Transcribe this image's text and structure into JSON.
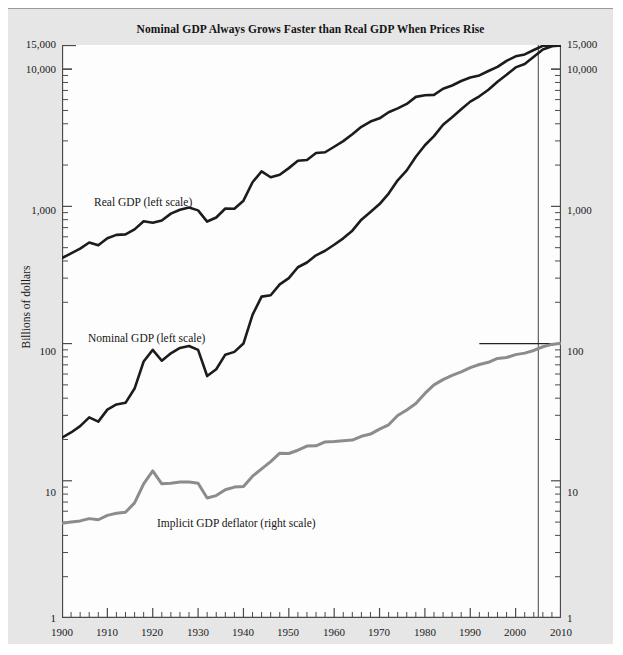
{
  "figure": {
    "title": "Nominal GDP Always Grows Faster than Real GDP When Prices Rise",
    "y_axis_left_title": "Billions of dollars",
    "y_axis_right_title": "Price index (the year 2005=100)",
    "background_color": "#e6e6e6",
    "plot_background_color": "#fdfdfd"
  },
  "series_labels": {
    "real_gdp": "Real GDP (left scale)",
    "nominal_gdp": "Nominal GDP (left scale)",
    "deflator": "Implicit GDP deflator (right scale)"
  },
  "axis_ticks": {
    "left": [
      "15,000",
      "10,000",
      "1,000",
      "100",
      "10",
      "1"
    ],
    "right": [
      "15,000",
      "10,000",
      "1,000",
      "100",
      "10",
      "1"
    ],
    "bottom": [
      "1900",
      "1910",
      "1920",
      "1930",
      "1940",
      "1950",
      "1960",
      "1970",
      "1980",
      "1990",
      "2000",
      "2010"
    ]
  },
  "chart_data": {
    "type": "line",
    "title": "Nominal GDP Always Grows Faster than Real GDP When Prices Rise",
    "xlabel": "",
    "ylabel": "Billions of dollars",
    "ylabel_right": "Price index (the year 2005=100)",
    "yscale": "log",
    "ylim": [
      1,
      15000
    ],
    "xlim": [
      1900,
      2010
    ],
    "grid": false,
    "legend": "inline-annotations",
    "left_axis_ticks": [
      1,
      10,
      100,
      1000,
      10000,
      15000
    ],
    "right_axis_ticks": [
      1,
      10,
      100,
      1000,
      10000,
      15000
    ],
    "x_ticks": [
      1900,
      1910,
      1920,
      1930,
      1940,
      1950,
      1960,
      1970,
      1980,
      1990,
      2000,
      2010
    ],
    "x_minor_tick_interval": 2,
    "reference_lines": [
      {
        "type": "vertical",
        "x": 2005,
        "label": "base year 2005",
        "color": "#555555"
      },
      {
        "type": "horizontal",
        "y": 100,
        "axis": "right",
        "x_start": 1992,
        "x_end": 2010,
        "label": "price index = 100 in 2005",
        "color": "#222222"
      }
    ],
    "x": [
      1900,
      1902,
      1904,
      1906,
      1908,
      1910,
      1912,
      1914,
      1916,
      1918,
      1920,
      1922,
      1924,
      1926,
      1928,
      1930,
      1932,
      1934,
      1936,
      1938,
      1940,
      1942,
      1944,
      1946,
      1948,
      1950,
      1952,
      1954,
      1956,
      1958,
      1960,
      1962,
      1964,
      1966,
      1968,
      1970,
      1972,
      1974,
      1976,
      1978,
      1980,
      1982,
      1984,
      1986,
      1988,
      1990,
      1992,
      1994,
      1996,
      1998,
      2000,
      2002,
      2004,
      2006,
      2008,
      2010
    ],
    "series": [
      {
        "name": "Real GDP (left scale)",
        "color": "#1c1c1c",
        "scale": "left",
        "units": "Billions of 2005 dollars",
        "values": [
          420,
          455,
          492,
          545,
          520,
          585,
          620,
          625,
          680,
          780,
          760,
          790,
          885,
          945,
          980,
          935,
          775,
          830,
          965,
          960,
          1100,
          1500,
          1800,
          1630,
          1700,
          1900,
          2150,
          2180,
          2450,
          2480,
          2720,
          2990,
          3350,
          3800,
          4150,
          4380,
          4850,
          5180,
          5580,
          6280,
          6450,
          6500,
          7200,
          7600,
          8200,
          8700,
          9000,
          9700,
          10400,
          11500,
          12400,
          12800,
          13800,
          14800,
          14900,
          14800
        ]
      },
      {
        "name": "Nominal GDP (left scale)",
        "color": "#1c1c1c",
        "scale": "left",
        "units": "Billions of current dollars",
        "values": [
          20.6,
          22.5,
          25,
          29,
          27,
          33,
          36,
          37,
          47,
          74,
          90,
          75,
          85,
          93,
          96,
          90,
          58,
          65,
          83,
          87,
          100,
          162,
          220,
          225,
          270,
          300,
          360,
          390,
          440,
          475,
          525,
          585,
          665,
          800,
          910,
          1040,
          1240,
          1550,
          1830,
          2300,
          2790,
          3250,
          3930,
          4460,
          5100,
          5800,
          6340,
          7080,
          8100,
          9100,
          10300,
          10900,
          12300,
          13900,
          14700,
          14900
        ]
      },
      {
        "name": "Implicit GDP deflator (right scale)",
        "color": "#8c8c8c",
        "scale": "right",
        "units": "Index, 2005 = 100",
        "values": [
          4.9,
          5.0,
          5.1,
          5.3,
          5.2,
          5.6,
          5.8,
          5.9,
          6.9,
          9.5,
          11.8,
          9.5,
          9.6,
          9.8,
          9.8,
          9.6,
          7.5,
          7.8,
          8.6,
          9.0,
          9.1,
          10.8,
          12.2,
          13.8,
          15.9,
          15.8,
          16.7,
          17.9,
          18.0,
          19.2,
          19.3,
          19.6,
          19.8,
          21.1,
          21.9,
          23.8,
          25.6,
          29.9,
          32.8,
          36.6,
          43.3,
          50.0,
          54.6,
          58.7,
          62.2,
          66.7,
          70.4,
          73.0,
          77.9,
          79.1,
          83.1,
          85.2,
          89.1,
          94.8,
          98.6,
          100.8
        ]
      }
    ]
  }
}
